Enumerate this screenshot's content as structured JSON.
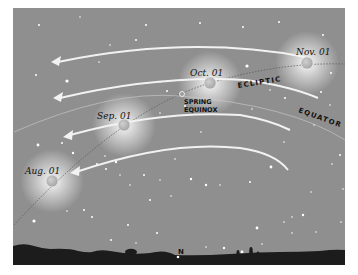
{
  "diagram": {
    "colors": {
      "sky": "#8f8f8f",
      "ground": "#1c1c1c",
      "arrow": "#f2f2f2",
      "planet": "#b8b8b8"
    },
    "labels": {
      "ecliptic": "ECLIPTIC",
      "equator": "EQUATOR",
      "spring_equinox_line1": "SPRING",
      "spring_equinox_line2": "EQUINOX",
      "north": "N"
    },
    "positions": [
      {
        "date": "Nov. 01"
      },
      {
        "date": "Oct. 01"
      },
      {
        "date": "Sep. 01"
      },
      {
        "date": "Aug. 01"
      }
    ],
    "arrows": {
      "count": 4,
      "direction": "left"
    }
  }
}
